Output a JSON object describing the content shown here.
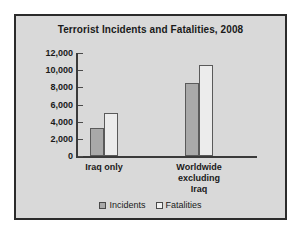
{
  "chart_data": {
    "type": "bar",
    "title": "Terrorist Incidents and Fatalities, 2008",
    "xlabel": "",
    "ylabel": "",
    "categories": [
      "Iraq only",
      "Worldwide excluding Iraq"
    ],
    "category_label_lines": [
      [
        "Iraq only"
      ],
      [
        "Worldwide",
        "excluding",
        "Iraq"
      ]
    ],
    "series": [
      {
        "name": "Incidents",
        "values": [
          3250,
          8500
        ],
        "color": "#a9a9a9"
      },
      {
        "name": "Fatalities",
        "values": [
          5000,
          10650
        ],
        "color": "#ececec"
      }
    ],
    "ylim": [
      0,
      12000
    ],
    "yticks": [
      0,
      2000,
      4000,
      6000,
      8000,
      10000,
      12000
    ],
    "ytick_labels": [
      "0",
      "2,000",
      "4,000",
      "6,000",
      "8,000",
      "10,000",
      "12,000"
    ],
    "grid": false,
    "legend_position": "bottom",
    "background_color": "#d9d9d9",
    "border_color": "#2b2b2b"
  }
}
